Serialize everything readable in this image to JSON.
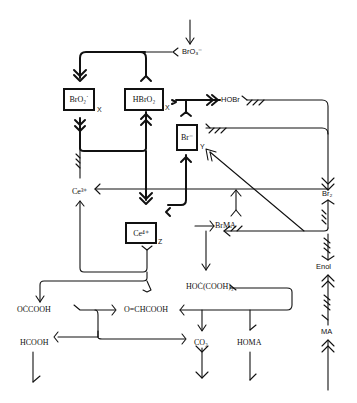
{
  "diagram": {
    "title": "",
    "type": "reaction mechanism network (Belousov-Zhabotinsky / FKN)",
    "boxes": [
      {
        "id": "bro2",
        "label": "BrO₂˙",
        "tag": "X"
      },
      {
        "id": "hbro2",
        "label": "HBrO₂",
        "tag": "X"
      },
      {
        "id": "br",
        "label": "Br⁻",
        "tag": "Y"
      },
      {
        "id": "ce4",
        "label": "Ce⁴⁺",
        "tag": "Z"
      }
    ],
    "species": {
      "bro3": "BrO₃⁻",
      "hobr": "HOBr",
      "ce3": "Ce³⁺",
      "br2": "Br₂",
      "brma": "BrMA",
      "enol": "Enol",
      "ma": "MA",
      "hoc_cooh2": "HOĊ(COOH)₂",
      "occooh": "OĊCOOH",
      "glyoxylic": "O=CHCOOH",
      "hcooh": "HCOOH",
      "co2": "CO₂",
      "homa": "HOMA"
    }
  }
}
